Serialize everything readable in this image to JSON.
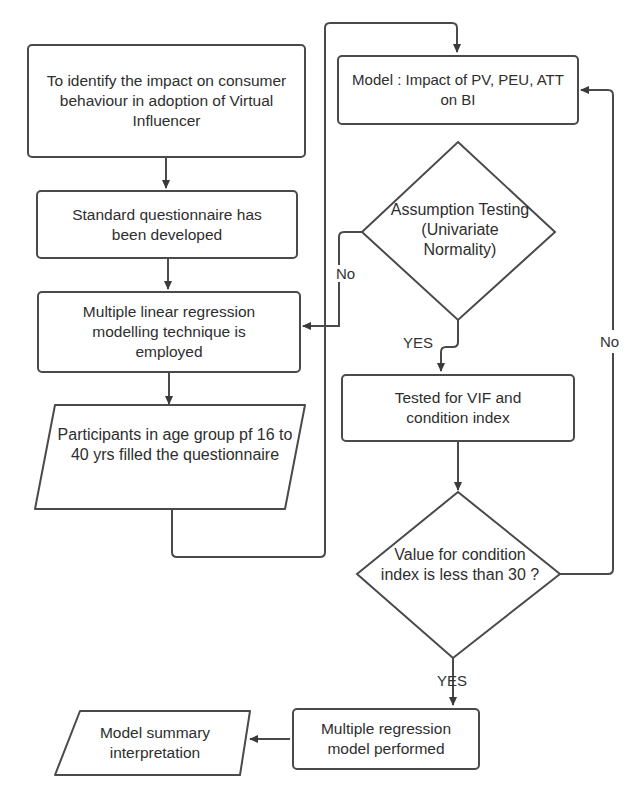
{
  "nodes": {
    "objective": "To identify the impact on consumer behaviour in adoption of Virtual Influencer",
    "questionnaire": "Standard questionnaire has been developed",
    "mlr_technique": "Multiple linear regression modelling technique is employed",
    "participants": "Participants in age group pf 16 to 40 yrs filled the questionnaire",
    "model": "Model : Impact of PV, PEU, ATT on BI",
    "assumption_testing": "Assumption Testing (Univariate Normality)",
    "vif_test": "Tested for VIF and condition index",
    "condition_check": "Value for condition index is less than 30 ?",
    "regression_performed": "Multiple regression model performed",
    "summary": "Model summary interpretation"
  },
  "edge_labels": {
    "assumption_no": "No",
    "assumption_yes": "YES",
    "condition_no": "No",
    "condition_yes": "YES"
  },
  "colors": {
    "stroke": "#4a4a4a",
    "text": "#2e2e2e",
    "background": "#ffffff"
  }
}
